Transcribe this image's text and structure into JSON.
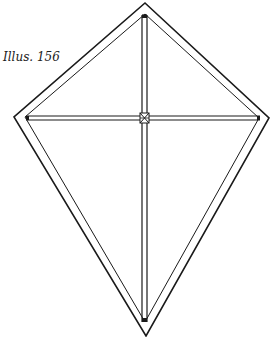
{
  "figure": {
    "caption": "Illus. 156",
    "colors": {
      "line": "#1a1a1a",
      "background": "#ffffff"
    },
    "outer_outline": {
      "top": [
        145,
        3
      ],
      "left": [
        14,
        117
      ],
      "right": [
        269,
        118
      ],
      "bottom": [
        146,
        336
      ]
    },
    "inner_outline": {
      "top": [
        145,
        14
      ],
      "left": [
        25,
        117
      ],
      "right": [
        259,
        118
      ],
      "bottom": [
        145,
        322
      ]
    },
    "vertical_spar": {
      "x_left": 142,
      "x_right": 147,
      "y_top": 15,
      "y_bottom": 322
    },
    "horizontal_spar": {
      "y_top": 116,
      "y_bottom": 120,
      "x_left": 26,
      "x_right": 260
    },
    "cross_joint": [
      144,
      118
    ]
  }
}
